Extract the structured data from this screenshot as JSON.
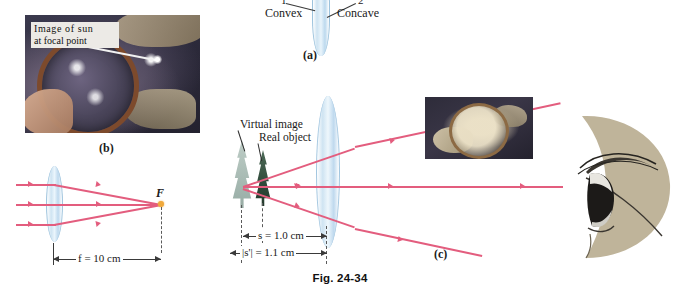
{
  "figure": {
    "caption": "Fig. 24-34"
  },
  "panel_a": {
    "label": "(a)",
    "surface_1_number": "1",
    "surface_2_number": "2",
    "convex_label": "Convex",
    "concave_label": "Concave",
    "lens_icon": "converging-lens-icon"
  },
  "panel_b": {
    "label": "(b)",
    "photo": {
      "caption_line1": "Image of sun",
      "caption_line2": "at focal point",
      "alt_name": "magnifying-glass-focusing-sunlight-photo"
    },
    "focal_point_label": "F",
    "focal_length_text": "f = 10 cm",
    "focal_length_value": 10,
    "focal_length_units": "cm",
    "ray_count": 3
  },
  "panel_c": {
    "label": "(c)",
    "virtual_image_label": "Virtual image",
    "real_object_label": "Real object",
    "object_distance_text": "s = 1.0 cm",
    "object_distance_value": 1.0,
    "image_distance_text": "|s'| = 1.1 cm",
    "image_distance_value": 1.1,
    "units": "cm",
    "photo_alt_name": "magnifier-over-object-photo",
    "eye_alt_name": "human-eye-side-view-illustration"
  },
  "colors": {
    "ray": "#e35d7e",
    "lens_glass": "#cfe4f2",
    "focal_dot": "#f0a93c",
    "object": "#2f4a3a",
    "virtual_image": "#9fb3ac",
    "eye_skin": "#bfb49a",
    "text": "#1a1a1a"
  }
}
